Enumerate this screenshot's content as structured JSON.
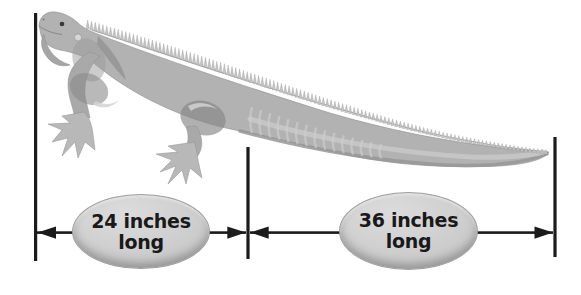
{
  "diagram": {
    "illustration_icon": "iguana-illustration",
    "measurements": [
      {
        "label": "24 inches",
        "sublabel": "long",
        "inches": 24
      },
      {
        "label": "36 inches",
        "sublabel": "long",
        "inches": 36
      }
    ]
  },
  "colors": {
    "background": "#ffffff",
    "dimension_line": "#1b1b1b",
    "oval_fill": "#c9c9c9",
    "oval_edge": "#9f9f9f",
    "label_text": "#191919",
    "iguana_base_gray": "#b2b2b2",
    "iguana_dark_gray": "#8a8a8a",
    "iguana_light_gray": "#d2d2d2"
  }
}
